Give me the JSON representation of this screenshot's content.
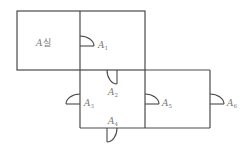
{
  "diagram": {
    "type": "floor-plan",
    "rooms": [
      {
        "id": "room-a",
        "label_main": "A",
        "label_suffix": "실"
      }
    ],
    "doors": [
      {
        "id": "A1",
        "letter": "A",
        "index": "1"
      },
      {
        "id": "A2",
        "letter": "A",
        "index": "2"
      },
      {
        "id": "A3",
        "letter": "A",
        "index": "3"
      },
      {
        "id": "A4",
        "letter": "A",
        "index": "4"
      },
      {
        "id": "A5",
        "letter": "A",
        "index": "5"
      },
      {
        "id": "A6",
        "letter": "A",
        "index": "6"
      }
    ],
    "colors": {
      "line": "#4a4a4a",
      "text": "#777777"
    }
  }
}
